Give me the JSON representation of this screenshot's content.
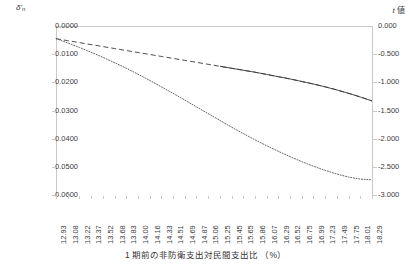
{
  "chart_data": {
    "type": "line",
    "title": "",
    "xlabel": "1 期前の非防衛支出対民間支出比 （%）",
    "left_axis": {
      "label": "δ'n",
      "label_main": "δ'",
      "label_sub": "n",
      "ticks": [
        "0.0000",
        "-0.0100",
        "-0.0200",
        "-0.0300",
        "-0.0400",
        "-0.0500",
        "-0.0600"
      ],
      "ylim": [
        -0.06,
        0.0
      ]
    },
    "right_axis": {
      "label": "t 値",
      "label_italic": "t",
      "label_rest": " 値",
      "ticks": [
        "0.000",
        "-0.500",
        "-1.000",
        "-1.500",
        "-2.000",
        "-2.500",
        "-3.000"
      ],
      "ylim": [
        -3.0,
        0.0
      ]
    },
    "categories": [
      "12.93",
      "13.08",
      "13.22",
      "13.37",
      "13.52",
      "13.68",
      "13.83",
      "14.00",
      "14.16",
      "14.33",
      "14.51",
      "14.69",
      "14.87",
      "15.06",
      "15.25",
      "15.45",
      "15.65",
      "15.86",
      "16.07",
      "16.29",
      "16.52",
      "16.75",
      "16.99",
      "17.23",
      "17.49",
      "17.75",
      "18.01",
      "18.29"
    ],
    "grid": false,
    "legend": "none",
    "series": [
      {
        "name": "δ'n",
        "axis": "left",
        "style": "dashed-then-solid",
        "color": "#3a3a3a",
        "values": [
          -0.0045,
          -0.0052,
          -0.0059,
          -0.0066,
          -0.0073,
          -0.008,
          -0.0087,
          -0.0094,
          -0.0101,
          -0.0108,
          -0.0115,
          -0.0122,
          -0.0129,
          -0.0136,
          -0.0143,
          -0.015,
          -0.0157,
          -0.0164,
          -0.0172,
          -0.018,
          -0.0188,
          -0.0197,
          -0.0206,
          -0.0216,
          -0.0227,
          -0.0239,
          -0.0252,
          -0.0266
        ]
      },
      {
        "name": "t 値",
        "axis": "right",
        "style": "dotted",
        "color": "#555555",
        "values": [
          -0.225,
          -0.3,
          -0.38,
          -0.465,
          -0.555,
          -0.65,
          -0.75,
          -0.855,
          -0.965,
          -1.08,
          -1.195,
          -1.315,
          -1.435,
          -1.555,
          -1.675,
          -1.795,
          -1.91,
          -2.02,
          -2.125,
          -2.225,
          -2.32,
          -2.408,
          -2.49,
          -2.563,
          -2.628,
          -2.682,
          -2.718,
          -2.73
        ]
      }
    ]
  }
}
